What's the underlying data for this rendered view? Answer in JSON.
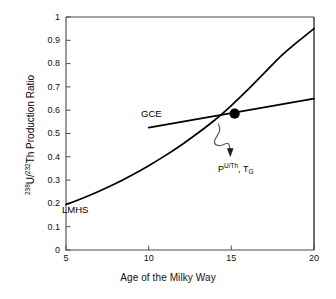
{
  "chart_data": {
    "type": "line",
    "title": "",
    "xlabel": "Age of the Milky Way",
    "ylabel": "238U/232Th Production Ratio",
    "ylabel_parts": {
      "sup1": "238",
      "mid1": "U/",
      "sup2": "232",
      "rest": "Th Production Ratio"
    },
    "xlim": [
      5,
      20
    ],
    "ylim": [
      0,
      1
    ],
    "grid": false,
    "legend": "none",
    "xticks": [
      "5",
      "10",
      "15",
      "20"
    ],
    "xtick_values": [
      5,
      10,
      15,
      20
    ],
    "yticks": [
      "0",
      "0.1",
      "0.2",
      "0.3",
      "0.4",
      "0.5",
      "0.6",
      "0.7",
      "0.8",
      "0.9",
      "1"
    ],
    "ytick_values": [
      0,
      0.1,
      0.2,
      0.3,
      0.4,
      0.5,
      0.6,
      0.7,
      0.8,
      0.9,
      1
    ],
    "series": [
      {
        "name": "LMHS",
        "label": "LMHS",
        "style": "curve",
        "color": "#000000",
        "x": [
          5,
          6,
          7,
          8,
          9,
          10,
          11,
          12,
          13,
          14,
          15,
          16,
          17,
          18,
          19,
          20
        ],
        "values": [
          0.195,
          0.222,
          0.252,
          0.285,
          0.322,
          0.362,
          0.405,
          0.452,
          0.503,
          0.558,
          0.62,
          0.688,
          0.76,
          0.832,
          0.893,
          0.95
        ]
      },
      {
        "name": "GCE",
        "label": "GCE",
        "style": "line",
        "color": "#000000",
        "x": [
          10,
          20
        ],
        "values": [
          0.525,
          0.65
        ]
      }
    ],
    "markers": [
      {
        "name": "intersection-point",
        "x": 15.2,
        "y": 0.585,
        "shape": "filled-circle",
        "color": "#000000"
      }
    ],
    "annotations": [
      {
        "name": "production-ratio-annotation",
        "text": "PU/Th, TG",
        "parts": {
          "p": "P",
          "sup": "U/Th",
          "comma": ", ",
          "t": "T",
          "sub": "G"
        },
        "x": 15.8,
        "y": 0.37,
        "leader": "curved-arrow"
      }
    ]
  },
  "labels": {
    "gce": "GCE",
    "lmhs": "LMHS"
  },
  "colors": {
    "axis": "#3a3a3a",
    "curve": "#111111",
    "marker": "#000000",
    "background": "#ffffff",
    "text": "#111111"
  }
}
